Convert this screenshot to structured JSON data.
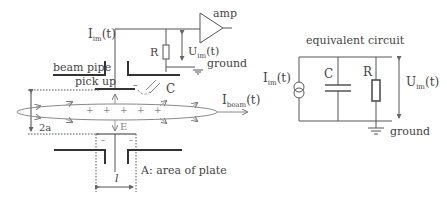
{
  "diagram": {
    "type": "schematic",
    "left": {
      "labels": {
        "current": "I",
        "current_sub": "im",
        "current_arg": "(t)",
        "amp": "amp",
        "resistor": "R",
        "voltage": "U",
        "voltage_sub": "im",
        "voltage_arg": "(t)",
        "ground": "ground",
        "beam_pipe": "beam pipe",
        "pick_up": "pick up",
        "capacitor": "C",
        "beam_current": "I",
        "beam_current_sub": "beam",
        "beam_current_arg": "(t)",
        "field": "E",
        "aperture": "2a",
        "plate_length": "l",
        "plate_area": "A: area of plate",
        "minus_top": "–",
        "minus_bottom_left": "–",
        "minus_bottom_right": "–"
      }
    },
    "right": {
      "title": "equivalent circuit",
      "labels": {
        "current": "I",
        "current_sub": "im",
        "current_arg": "(t)",
        "capacitor": "C",
        "resistor": "R",
        "voltage": "U",
        "voltage_sub": "im",
        "voltage_arg": "(t)",
        "ground": "ground"
      }
    },
    "colors": {
      "line": "#555555",
      "thick": "#333333",
      "gray": "#999999"
    }
  }
}
